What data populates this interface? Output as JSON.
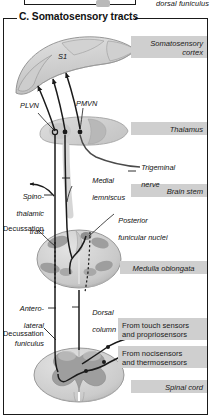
{
  "figure": {
    "section_letter": "C.",
    "section_title": "C. Somatosensory tracts",
    "cut_off_above_label": "dorsal funiculus"
  },
  "region_labels": [
    {
      "id": "somatosensory-cortex",
      "text": "Somatosensory\ncortex",
      "align": "right",
      "style": "italic",
      "box": true
    },
    {
      "id": "thalamus",
      "text": "Thalamus",
      "align": "right",
      "style": "italic",
      "box": true
    },
    {
      "id": "brain-stem",
      "text": "Brain stem",
      "align": "right",
      "style": "italic",
      "box": true
    },
    {
      "id": "medulla-oblongata",
      "text": "Medulla oblongata",
      "align": "center",
      "style": "italic",
      "box": true
    },
    {
      "id": "spinal-cord",
      "text": "Spinal cord",
      "align": "right",
      "style": "italic",
      "box": true
    },
    {
      "id": "from-touch",
      "text": "From touch sensors\nand propriosensors",
      "align": "left",
      "style": "normal",
      "box": true
    },
    {
      "id": "from-noci",
      "text": "From nocisensors\nand thermosensors",
      "align": "left",
      "style": "normal",
      "box": true
    }
  ],
  "structure_labels": [
    {
      "id": "s1",
      "text": "S1",
      "style": "italic"
    },
    {
      "id": "plvn",
      "text": "PLVN",
      "style": "italic"
    },
    {
      "id": "pmvn",
      "text": "PMVN",
      "style": "italic"
    },
    {
      "id": "trigeminal-nerve",
      "text": "Trigeminal\nnerve",
      "style": "italic"
    },
    {
      "id": "medial-lemniscus",
      "text": "Medial\nlemniscus",
      "style": "italic"
    },
    {
      "id": "spinothalamic-tract",
      "text": "Spino-\nthalamic\ntract",
      "style": "italic"
    },
    {
      "id": "posterior-funicular-nuclei",
      "text": "Posterior\nfunicular nuclei",
      "style": "italic"
    },
    {
      "id": "decussation-medulla",
      "text": "Decussation",
      "style": "normal"
    },
    {
      "id": "anterolateral-funiculus",
      "text": "Antero-\nlateral\nfuniculus",
      "style": "italic"
    },
    {
      "id": "dorsal-column",
      "text": "Dorsal\ncolumn",
      "style": "italic"
    },
    {
      "id": "decussation-spinal",
      "text": "Decussation",
      "style": "normal"
    }
  ],
  "text": {
    "somatosensory_cortex_l1": "Somatosensory",
    "somatosensory_cortex_l2": "cortex",
    "thalamus": "Thalamus",
    "brain_stem": "Brain stem",
    "medulla_oblongata": "Medulla oblongata",
    "spinal_cord": "Spinal cord",
    "from_touch_l1": "From touch sensors",
    "from_touch_l2": "and propriosensors",
    "from_noci_l1": "From nocisensors",
    "from_noci_l2": "and thermosensors",
    "s1": "S1",
    "plvn": "PLVN",
    "pmvn": "PMVN",
    "trigeminal_l1": "Trigeminal",
    "trigeminal_l2": "nerve",
    "medial_lem_l1": "Medial",
    "medial_lem_l2": "lemniscus",
    "spinothalamic_l1": "Spino-",
    "spinothalamic_l2": "thalamic",
    "spinothalamic_l3": "tract",
    "post_fun_l1": "Posterior",
    "post_fun_l2": "funicular nuclei",
    "decussation_medulla": "Decussation",
    "antlat_l1": "Antero-",
    "antlat_l2": "lateral",
    "antlat_l3": "funiculus",
    "dorsal_col_l1": "Dorsal",
    "dorsal_col_l2": "column",
    "decussation_spinal": "Decussation",
    "dorsal_funiculus": "dorsal funiculus",
    "section_title": "C. Somatosensory tracts"
  },
  "colors": {
    "page_bg": "#ffffff",
    "label_box": "#cfcfcf",
    "tissue_light": "#d8d8d8",
    "tissue_mid": "#c2c2c2",
    "tissue_dark": "#a8a8a8",
    "gray_matter": "#9e9e9e",
    "outline": "#6f6f6f",
    "tract_line": "#1a1a1a",
    "frame": "#1a1a1a",
    "text": "#111111"
  },
  "diagram": {
    "type": "anatomical-schematic",
    "pathways": [
      {
        "name": "dorsal-column-medial-lemniscus",
        "from": "touch and propriosensors",
        "relays": [
          "posterior funicular nuclei",
          "PMVN/thalamus"
        ],
        "to": "S1 cortex"
      },
      {
        "name": "spinothalamic-tract",
        "from": "nocisensors and thermosensors",
        "relays": [
          "spinal cord decussation",
          "PLVN/thalamus"
        ],
        "to": "S1 cortex"
      },
      {
        "name": "trigeminal",
        "from": "trigeminal nerve",
        "relays": [
          "brain stem",
          "PMVN/thalamus"
        ],
        "to": "S1 cortex"
      }
    ]
  }
}
